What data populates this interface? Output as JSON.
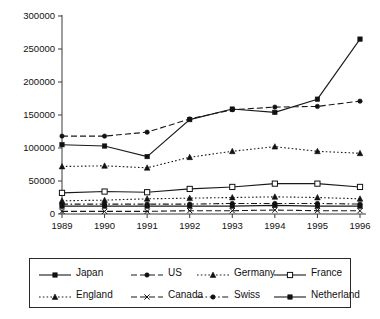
{
  "chart_data": {
    "type": "line",
    "title": "",
    "xlabel": "",
    "ylabel": "",
    "categories": [
      "1989",
      "1990",
      "1991",
      "1992",
      "1993",
      "1994",
      "1995",
      "1996"
    ],
    "ylim": [
      0,
      300000
    ],
    "ytick_labels": [
      "0",
      "50000",
      "100000",
      "150000",
      "200000",
      "250000",
      "300000"
    ],
    "ytick_values": [
      0,
      50000,
      100000,
      150000,
      200000,
      250000,
      300000
    ],
    "grid": false,
    "legend_position": "bottom",
    "series": [
      {
        "name": "Japan",
        "values": [
          105000,
          103000,
          87000,
          143000,
          159000,
          154000,
          174000,
          265000
        ],
        "line_style": "solid",
        "marker": "filled-square"
      },
      {
        "name": "US",
        "values": [
          118000,
          118000,
          124000,
          144000,
          158000,
          162000,
          163000,
          171000
        ],
        "line_style": "dashed",
        "marker": "filled-circle"
      },
      {
        "name": "Germany",
        "values": [
          72000,
          73000,
          70000,
          86000,
          95000,
          102000,
          95000,
          92000
        ],
        "line_style": "dotted",
        "marker": "filled-triangle"
      },
      {
        "name": "France",
        "values": [
          32000,
          34000,
          33000,
          38000,
          41000,
          46000,
          46000,
          41000
        ],
        "line_style": "solid",
        "marker": "open-square"
      },
      {
        "name": "England",
        "values": [
          20000,
          21000,
          23000,
          24000,
          25000,
          26000,
          25000,
          23000
        ],
        "line_style": "dotted",
        "marker": "filled-triangle"
      },
      {
        "name": "Canada",
        "values": [
          4000,
          4000,
          4000,
          5000,
          5000,
          6000,
          5000,
          5000
        ],
        "line_style": "dashed",
        "marker": "cross"
      },
      {
        "name": "Swiss",
        "values": [
          15000,
          15000,
          15000,
          15000,
          16000,
          16000,
          16000,
          15000
        ],
        "line_style": "dash-dot",
        "marker": "filled-circle"
      },
      {
        "name": "Netherland",
        "values": [
          12000,
          12000,
          12000,
          12000,
          12000,
          13000,
          12000,
          12000
        ],
        "line_style": "solid",
        "marker": "filled-square"
      }
    ]
  },
  "legend": {
    "rows": [
      [
        {
          "label": "Japan",
          "sample": "solid-line-filled-square-marker"
        },
        {
          "label": "US",
          "sample": "dashed-line-filled-circle-marker"
        },
        {
          "label": "Germany",
          "sample": "dotted-line-filled-triangle-marker"
        },
        {
          "label": "France",
          "sample": "solid-line-open-square-marker"
        }
      ],
      [
        {
          "label": "England",
          "sample": "dotted-line-filled-triangle-marker"
        },
        {
          "label": "Canada",
          "sample": "dashed-line-cross-marker"
        },
        {
          "label": "Swiss",
          "sample": "dash-dot-line-filled-circle-marker"
        },
        {
          "label": "Netherland",
          "sample": "solid-line-filled-square-marker"
        }
      ]
    ]
  },
  "colors": {
    "ink": "#111111",
    "axis": "#3a3a3a",
    "background": "#ffffff"
  }
}
